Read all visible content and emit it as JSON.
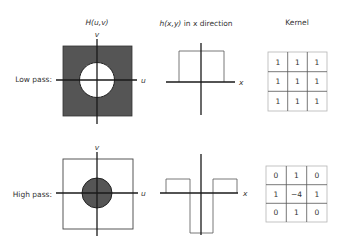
{
  "headers": {
    "freq": "H(u,v)",
    "spatial_italic": "h(x,y)",
    "spatial_rest": " in x direction",
    "kernel": "Kernel"
  },
  "axes": {
    "u": "u",
    "v": "v",
    "x": "x"
  },
  "colors": {
    "dark_fill": "#555555",
    "light_fill": "#ffffff",
    "line": "#1a1a1a"
  },
  "rows": [
    {
      "label": "Low pass:",
      "kernel": [
        [
          "1",
          "1",
          "1"
        ],
        [
          "1",
          "1",
          "1"
        ],
        [
          "1",
          "1",
          "1"
        ]
      ]
    },
    {
      "label": "High pass:",
      "kernel": [
        [
          "0",
          "1",
          "0"
        ],
        [
          "1",
          "−4",
          "1"
        ],
        [
          "0",
          "1",
          "0"
        ]
      ]
    }
  ]
}
